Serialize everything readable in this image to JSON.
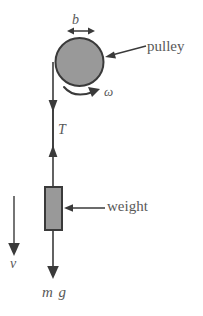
{
  "figure": {
    "background_color": "#ffffff",
    "stroke_color": "#3a3a3a",
    "fill_gray": "#999999",
    "text_color": "#595959"
  },
  "labels": {
    "diameter": "b",
    "angular_velocity": "ω",
    "pulley": "pulley",
    "tension": "T",
    "weight": "weight",
    "velocity": "v",
    "gravity_force": "m g"
  },
  "elements": {
    "pulley": {
      "name": "pulley-disc",
      "shape": "circle",
      "center_x": 79.5,
      "center_y": 62,
      "radius": 24,
      "fill": "#999999",
      "stroke": "#3a3a3a"
    },
    "weight_block": {
      "name": "weight-block",
      "shape": "rect",
      "x": 45,
      "y": 187,
      "width": 17,
      "height": 43,
      "fill": "#999999",
      "stroke": "#3a3a3a"
    },
    "rope": {
      "name": "rope-line",
      "x": 53,
      "y_top": 62,
      "y_bottom": 278
    },
    "dimension_arrow_b": {
      "name": "dimension-arrow-b",
      "y": 31,
      "x_left": 67,
      "x_right": 95,
      "double_headed": true
    },
    "tension_arrow": {
      "name": "tension-double-arrow",
      "x": 53,
      "y_top": 100,
      "y_bottom": 156,
      "double_headed": true
    },
    "velocity_arrow": {
      "name": "velocity-arrow",
      "x": 14,
      "y_top": 196,
      "y_bottom": 256,
      "direction": "down"
    },
    "gravity_arrow": {
      "name": "gravity-arrow",
      "x": 53,
      "y_top": 230,
      "y_bottom": 279,
      "direction": "down"
    },
    "rotation_arrow": {
      "name": "rotation-curved-arrow",
      "direction": "clockwise",
      "center_x": 79.5,
      "center_y": 62
    },
    "pulley_leader": {
      "name": "pulley-leader-line",
      "x_tip": 105,
      "y_tip": 57,
      "x_end": 146,
      "y_end": 46
    },
    "weight_leader": {
      "name": "weight-leader-line",
      "x_tip": 64,
      "y_tip": 208,
      "x_end": 105,
      "y_end": 208
    }
  }
}
